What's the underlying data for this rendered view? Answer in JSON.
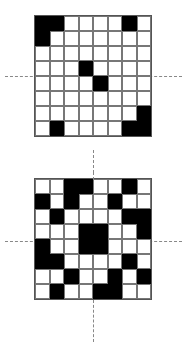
{
  "figure": {
    "grid_size": 8,
    "colors": {
      "filled": "#000000",
      "empty": "#ffffff",
      "line": "#777777",
      "dash": "#888888"
    }
  },
  "grids": [
    {
      "name": "top-grid",
      "rows": [
        [
          1,
          1,
          0,
          0,
          0,
          0,
          1,
          0
        ],
        [
          1,
          0,
          0,
          0,
          0,
          0,
          0,
          0
        ],
        [
          0,
          0,
          0,
          0,
          0,
          0,
          0,
          0
        ],
        [
          0,
          0,
          0,
          1,
          0,
          0,
          0,
          0
        ],
        [
          0,
          0,
          0,
          0,
          1,
          0,
          0,
          0
        ],
        [
          0,
          0,
          0,
          0,
          0,
          0,
          0,
          0
        ],
        [
          0,
          0,
          0,
          0,
          0,
          0,
          0,
          1
        ],
        [
          0,
          1,
          0,
          0,
          0,
          0,
          1,
          1
        ]
      ]
    },
    {
      "name": "bottom-grid",
      "rows": [
        [
          0,
          0,
          1,
          1,
          0,
          0,
          1,
          0
        ],
        [
          1,
          0,
          1,
          0,
          0,
          1,
          0,
          0
        ],
        [
          0,
          1,
          0,
          0,
          0,
          0,
          1,
          1
        ],
        [
          0,
          0,
          0,
          1,
          1,
          0,
          0,
          1
        ],
        [
          1,
          0,
          0,
          1,
          1,
          0,
          0,
          0
        ],
        [
          1,
          1,
          0,
          0,
          0,
          0,
          1,
          0
        ],
        [
          0,
          0,
          1,
          0,
          0,
          1,
          0,
          1
        ],
        [
          0,
          1,
          0,
          0,
          1,
          1,
          0,
          0
        ]
      ]
    }
  ]
}
